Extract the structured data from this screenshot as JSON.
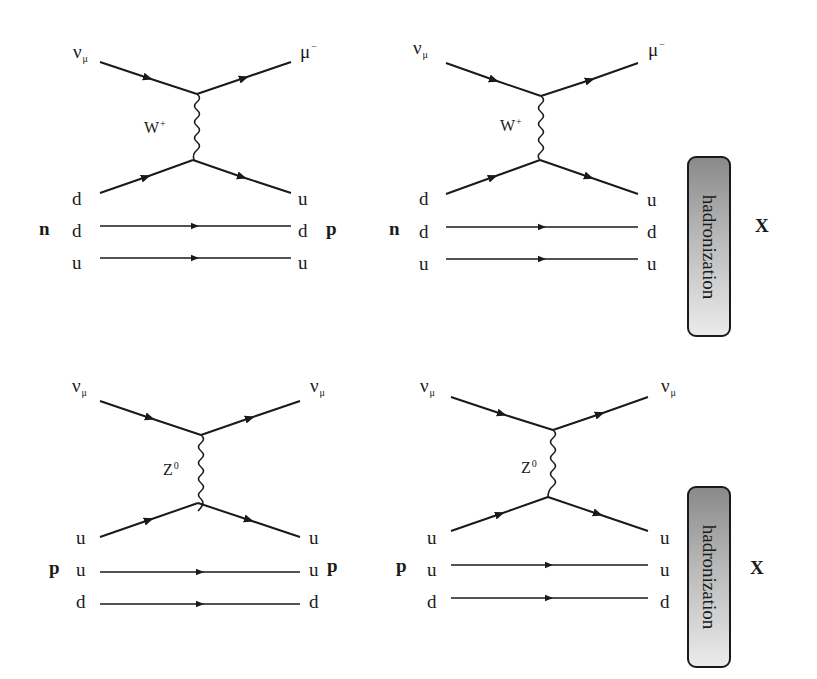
{
  "colors": {
    "line": "#1a1a1a",
    "box_top": "#8a8a8a",
    "box_bottom": "#ebebeb",
    "background": "#ffffff"
  },
  "diagrams": [
    {
      "id": "cc-quark",
      "process": "charged current",
      "incoming_lepton": {
        "base": "ν",
        "sub": "μ"
      },
      "outgoing_lepton": {
        "base": "μ",
        "sup": "−"
      },
      "boson": {
        "base": "W",
        "sup": "+"
      },
      "incoming_hadron": "n",
      "outgoing_hadron": "p",
      "left_quarks": [
        "d",
        "d",
        "u"
      ],
      "right_quarks": [
        "u",
        "d",
        "u"
      ]
    },
    {
      "id": "cc-hadronization",
      "process": "charged current",
      "incoming_lepton": {
        "base": "ν",
        "sub": "μ"
      },
      "outgoing_lepton": {
        "base": "μ",
        "sup": "−"
      },
      "boson": {
        "base": "W",
        "sup": "+"
      },
      "incoming_hadron": "n",
      "left_quarks": [
        "d",
        "d",
        "u"
      ],
      "right_quarks": [
        "u",
        "d",
        "u"
      ],
      "box_label": "hadronization",
      "final_state": "X"
    },
    {
      "id": "nc-quark",
      "process": "neutral current",
      "incoming_lepton": {
        "base": "ν",
        "sub": "μ"
      },
      "outgoing_lepton": {
        "base": "ν",
        "sub": "μ"
      },
      "boson": {
        "base": "Z",
        "sup": "0"
      },
      "incoming_hadron": "p",
      "outgoing_hadron": "p",
      "left_quarks": [
        "u",
        "u",
        "d"
      ],
      "right_quarks": [
        "u",
        "u",
        "d"
      ]
    },
    {
      "id": "nc-hadronization",
      "process": "neutral current",
      "incoming_lepton": {
        "base": "ν",
        "sub": "μ"
      },
      "outgoing_lepton": {
        "base": "ν",
        "sub": "μ"
      },
      "boson": {
        "base": "Z",
        "sup": "0"
      },
      "incoming_hadron": "p",
      "left_quarks": [
        "u",
        "u",
        "d"
      ],
      "right_quarks": [
        "u",
        "u",
        "d"
      ],
      "box_label": "hadronization",
      "final_state": "X"
    }
  ]
}
